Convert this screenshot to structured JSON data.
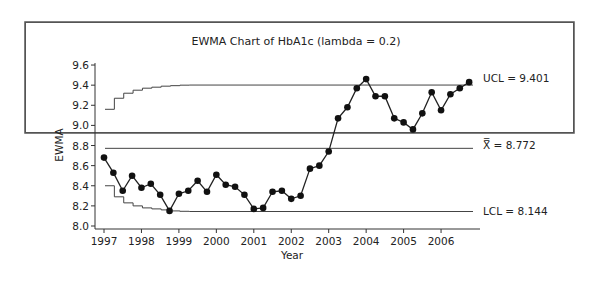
{
  "chart_data": {
    "type": "line",
    "title": "EWMA Chart of HbA1c (lambda = 0.2)",
    "xlabel": "Year",
    "ylabel": "EWMA",
    "ylim": [
      8.0,
      9.6
    ],
    "yticks": [
      8.0,
      8.2,
      8.4,
      8.6,
      8.8,
      9.0,
      9.2,
      9.4,
      9.6
    ],
    "ytick_labels": [
      "8.0",
      "8.2",
      "8.4",
      "8.6",
      "8.8",
      "9.0",
      "9.2",
      "9.4",
      "9.6"
    ],
    "xticks": [
      1997,
      1998,
      1999,
      2000,
      2001,
      2002,
      2003,
      2004,
      2005,
      2006
    ],
    "xtick_labels": [
      "1997",
      "1998",
      "1999",
      "2000",
      "2001",
      "2002",
      "2003",
      "2004",
      "2005",
      "2006"
    ],
    "grid": false,
    "legend": null,
    "center_line": {
      "label": "X̿ = 8.772",
      "value": 8.772
    },
    "ucl": {
      "label": "UCL = 9.401",
      "value": 9.401,
      "steps": [
        9.16,
        9.27,
        9.32,
        9.35,
        9.37,
        9.38,
        9.39,
        9.395,
        9.4
      ]
    },
    "lcl": {
      "label": "LCL = 8.144",
      "value": 8.144,
      "steps": [
        8.4,
        8.29,
        8.23,
        8.2,
        8.18,
        8.17,
        8.16,
        8.15,
        8.146
      ]
    },
    "series": [
      {
        "name": "EWMA",
        "marker": "filled-circle",
        "x": [
          1997.0,
          1997.25,
          1997.5,
          1997.75,
          1998.0,
          1998.25,
          1998.5,
          1998.75,
          1999.0,
          1999.25,
          1999.5,
          1999.75,
          2000.0,
          2000.25,
          2000.5,
          2000.75,
          2001.0,
          2001.25,
          2001.5,
          2001.75,
          2002.0,
          2002.25,
          2002.5,
          2002.75,
          2003.0,
          2003.25,
          2003.5,
          2003.75,
          2004.0,
          2004.25,
          2004.5,
          2004.75,
          2005.0,
          2005.25,
          2005.5,
          2005.75,
          2006.0,
          2006.25,
          2006.5,
          2006.75
        ],
        "values": [
          8.68,
          8.53,
          8.35,
          8.5,
          8.38,
          8.42,
          8.31,
          8.15,
          8.32,
          8.35,
          8.45,
          8.34,
          8.51,
          8.41,
          8.39,
          8.31,
          8.17,
          8.18,
          8.34,
          8.35,
          8.27,
          8.3,
          8.57,
          8.6,
          8.74,
          9.07,
          9.18,
          9.37,
          9.46,
          9.29,
          9.29,
          9.07,
          9.03,
          8.96,
          9.12,
          9.33,
          9.15,
          9.31,
          9.37,
          9.43
        ]
      }
    ]
  },
  "colors": {
    "line": "#222222",
    "marker": "#111111",
    "limits": "#444444",
    "frame": "#555555"
  }
}
